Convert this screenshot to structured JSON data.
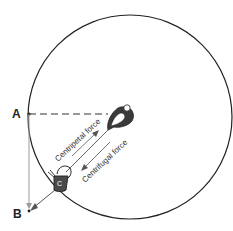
{
  "diagram": {
    "points": {
      "a": "A",
      "b": "B",
      "c": "C"
    },
    "forces": {
      "centripetal": "Centripetal force",
      "centrifugal": "Centrifugal force"
    },
    "colors": {
      "circle": "#222222",
      "arrow": "#555555",
      "tangent": "#9a9a9a",
      "figure": "#3a3a3a"
    }
  }
}
